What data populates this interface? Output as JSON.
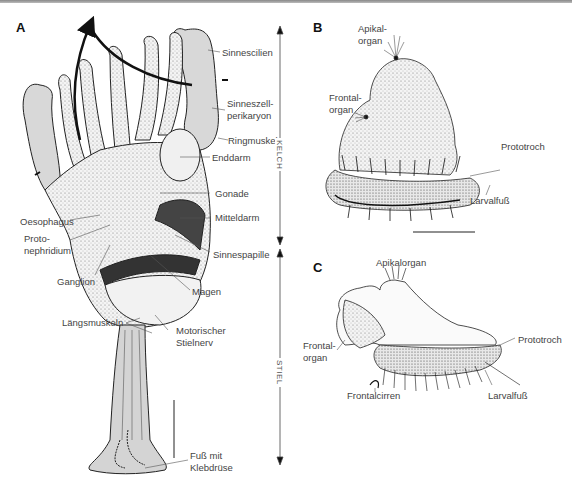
{
  "figure": {
    "panels": {
      "A": {
        "letter": "A",
        "labels": {
          "sinnescilien": "Sinnescilien",
          "sinneszell_1": "Sinneszell-",
          "sinneszell_2": "perikaryon",
          "ringmuskel": "Ringmuskel",
          "enddarm": "Enddarm",
          "gonade": "Gonade",
          "mitteldarm": "Mitteldarm",
          "oesophagus": "Oesophagus",
          "proto_1": "Proto-",
          "proto_2": "nephridium",
          "sinnespapille": "Sinnespapille",
          "ganglion": "Ganglion",
          "magen": "Magen",
          "laengsmuskeln": "Längsmuskeln",
          "motorisch_1": "Motorischer",
          "motorisch_2": "Stielnerv",
          "fuss_1": "Fuß mit",
          "fuss_2": "Klebdrüse"
        },
        "axis": {
          "kelch": "KELCH",
          "stiel": "STIEL"
        }
      },
      "B": {
        "letter": "B",
        "labels": {
          "apikal_1": "Apikal-",
          "apikal_2": "organ",
          "frontal_1": "Frontal-",
          "frontal_2": "organ",
          "prototroch": "Prototroch",
          "larvalfuss": "Larvalfuß"
        }
      },
      "C": {
        "letter": "C",
        "labels": {
          "apikalorgan": "Apikalorgan",
          "frontal_1": "Frontal-",
          "frontal_2": "organ",
          "prototroch": "Prototroch",
          "frontalcirren": "Frontalcirren",
          "larvalfuss": "Larvalfuß"
        }
      }
    }
  }
}
